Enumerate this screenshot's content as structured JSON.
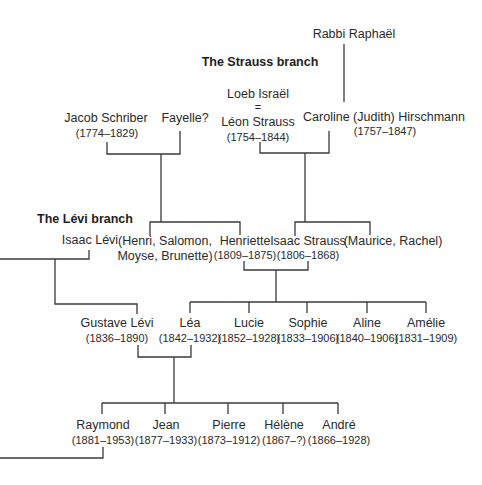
{
  "diagram": {
    "type": "family-tree",
    "headings": {
      "strauss_branch": "The Strauss branch",
      "levi_branch": "The Lévi branch"
    },
    "generation_0": {
      "rabbi_raphael": {
        "name": "Rabbi Raphaël"
      }
    },
    "generation_1": {
      "jacob_schriber": {
        "name": "Jacob Schriber",
        "dates": "(1774–1829)"
      },
      "fayelle": {
        "name": "Fayelle?"
      },
      "leon_strauss": {
        "alias": "Loeb Israël",
        "equals": "=",
        "name": "Léon Strauss",
        "dates": "(1754–1844)"
      },
      "caroline": {
        "name": "Caroline (Judith) Hirschmann",
        "dates": "(1757–1847)"
      }
    },
    "generation_2": {
      "isaac_levi": {
        "name": "Isaac Lévi"
      },
      "schriber_siblings": {
        "line1": "(Henri, Salomon,",
        "line2": "Moyse, Brunette)"
      },
      "henriette": {
        "name": "Henriette",
        "dates": "(1809–1875)"
      },
      "isaac_strauss": {
        "name": "Isaac Strauss",
        "dates": "(1806–1868)"
      },
      "strauss_siblings": {
        "name": "(Maurice, Rachel)"
      }
    },
    "generation_3": [
      {
        "name": "Gustave Lévi",
        "dates": "(1836–1890)"
      },
      {
        "name": "Léa",
        "dates": "(1842–1932)"
      },
      {
        "name": "Lucie",
        "dates": "(1852–1928)"
      },
      {
        "name": "Sophie",
        "dates": "(1833–1906)"
      },
      {
        "name": "Aline",
        "dates": "(1840–1906)"
      },
      {
        "name": "Amélie",
        "dates": "(1831–1909)"
      }
    ],
    "generation_4": [
      {
        "name": "Raymond",
        "dates": "(1881–1953)"
      },
      {
        "name": "Jean",
        "dates": "(1877–1933)"
      },
      {
        "name": "Pierre",
        "dates": "(1873–1912)"
      },
      {
        "name": "Hélène",
        "dates": "(1867–?)"
      },
      {
        "name": "André",
        "dates": "(1866–1928)"
      }
    ],
    "colors": {
      "background": "#ffffff",
      "text": "#2a2a2a",
      "lines": "#3a3a3a"
    }
  }
}
